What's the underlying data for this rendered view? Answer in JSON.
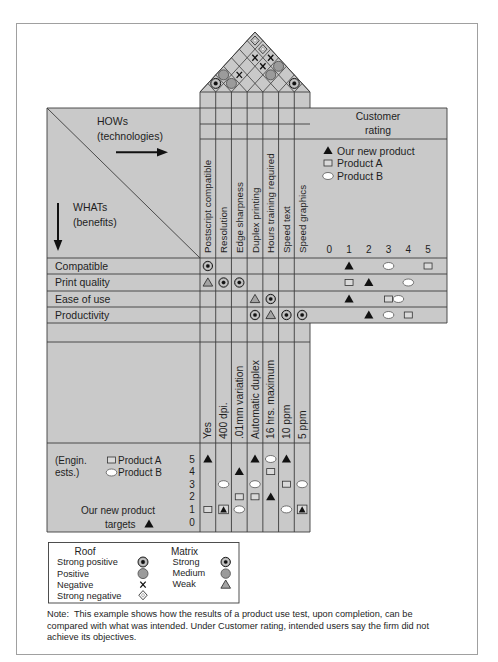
{
  "figure": {
    "hows_label": "HOWs",
    "hows_sub": "(technologies)",
    "whats_label": "WHATs",
    "whats_sub": "(benefits)",
    "customer_rating": {
      "title_line1": "Customer",
      "title_line2": "rating",
      "legend": [
        {
          "symbol": "black-triangle",
          "label": "Our new product"
        },
        {
          "symbol": "square",
          "label": "Product A"
        },
        {
          "symbol": "ellipse",
          "label": "Product B"
        }
      ],
      "scale": [
        "0",
        "1",
        "2",
        "3",
        "4",
        "5"
      ],
      "ratings": [
        {
          "what": "Compatible",
          "our_new_product": 1,
          "product_a": 5,
          "product_b": 3
        },
        {
          "what": "Print quality",
          "our_new_product": 2,
          "product_a": 1,
          "product_b": 4
        },
        {
          "what": "Ease of use",
          "our_new_product": 1,
          "product_a": 3,
          "product_b": 3.5
        },
        {
          "what": "Productivity",
          "our_new_product": 2,
          "product_a": 4,
          "product_b": 3
        }
      ]
    },
    "hows": [
      "Postscript compatible",
      "Resolution",
      "Edge sharpness",
      "Duplex printing",
      "Hours training required",
      "Speed text",
      "Speed graphics"
    ],
    "whats": [
      "Compatible",
      "Print quality",
      "Ease of use",
      "Productivity"
    ],
    "relationships": [
      {
        "row": 0,
        "col": 0,
        "strength": "strong"
      },
      {
        "row": 1,
        "col": 0,
        "strength": "weak"
      },
      {
        "row": 1,
        "col": 1,
        "strength": "strong"
      },
      {
        "row": 1,
        "col": 2,
        "strength": "strong"
      },
      {
        "row": 2,
        "col": 3,
        "strength": "weak"
      },
      {
        "row": 2,
        "col": 4,
        "strength": "strong"
      },
      {
        "row": 3,
        "col": 3,
        "strength": "strong"
      },
      {
        "row": 3,
        "col": 4,
        "strength": "weak"
      },
      {
        "row": 3,
        "col": 5,
        "strength": "strong"
      },
      {
        "row": 3,
        "col": 6,
        "strength": "strong"
      }
    ],
    "roof": [
      {
        "a": 0,
        "b": 1,
        "type": "strong_positive"
      },
      {
        "a": 5,
        "b": 6,
        "type": "strong_positive"
      },
      {
        "a": 1,
        "b": 2,
        "type": "positive"
      },
      {
        "a": 0,
        "b": 2,
        "type": "positive"
      },
      {
        "a": 3,
        "b": 5,
        "type": "positive"
      },
      {
        "a": 3,
        "b": 6,
        "type": "positive"
      },
      {
        "a": 1,
        "b": 3,
        "type": "negative"
      },
      {
        "a": 2,
        "b": 5,
        "type": "negative"
      },
      {
        "a": 1,
        "b": 5,
        "type": "negative"
      },
      {
        "a": 2,
        "b": 6,
        "type": "negative"
      },
      {
        "a": 1,
        "b": 6,
        "type": "strong_negative"
      },
      {
        "a": 0,
        "b": 6,
        "type": "strong_negative"
      }
    ],
    "targets": [
      "Yes",
      "400 dpi.",
      ".01mm variation",
      "Automatic duplex",
      "16 hrs. maximum",
      "10 ppm",
      "5 ppm"
    ],
    "engineering_estimates": {
      "label_line1": "(Engin.",
      "label_line2": "ests.)",
      "product_a_label": "Product A",
      "product_b_label": "Product B",
      "targets_line1": "Our new product",
      "targets_line2": "targets",
      "scale": [
        "5",
        "4",
        "3",
        "2",
        "1",
        "0"
      ],
      "columns": [
        {
          "how": "Postscript compatible",
          "our_new_product": 5,
          "product_a": 1,
          "product_b": null
        },
        {
          "how": "Resolution",
          "our_new_product": 1,
          "product_a": 1,
          "product_b": 3
        },
        {
          "how": "Edge sharpness",
          "our_new_product": 4,
          "product_a": 2,
          "product_b": 1
        },
        {
          "how": "Duplex printing",
          "our_new_product": 5,
          "product_a": 2,
          "product_b": 3
        },
        {
          "how": "Hours training required",
          "our_new_product": 2,
          "product_a": 4,
          "product_b": 5
        },
        {
          "how": "Speed text",
          "our_new_product": 5,
          "product_a": 3,
          "product_b": 1
        },
        {
          "how": "Speed graphics",
          "our_new_product": 1,
          "product_a": 1,
          "product_b": 3
        }
      ]
    }
  },
  "legend": {
    "roof_title": "Roof",
    "roof_items": [
      {
        "label": "Strong positive",
        "symbol": "strong_positive"
      },
      {
        "label": "Positive",
        "symbol": "positive"
      },
      {
        "label": "Negative",
        "symbol": "negative"
      },
      {
        "label": "Strong negative",
        "symbol": "strong_negative"
      }
    ],
    "matrix_title": "Matrix",
    "matrix_items": [
      {
        "label": "Strong",
        "symbol": "strong"
      },
      {
        "label": "Medium",
        "symbol": "medium"
      },
      {
        "label": "Weak",
        "symbol": "weak"
      }
    ]
  },
  "note": {
    "lines": [
      "Note:  This example shows how the results of a product use test, upon completion, can be",
      "compared with what was intended. Under Customer rating, intended users say the firm did not",
      "achieve its objectives."
    ]
  },
  "colors": {
    "panel_gray": "#c9c9c9",
    "line": "#3c3c3c",
    "text": "#1e1e1e",
    "frame": "#a0a0a0"
  }
}
